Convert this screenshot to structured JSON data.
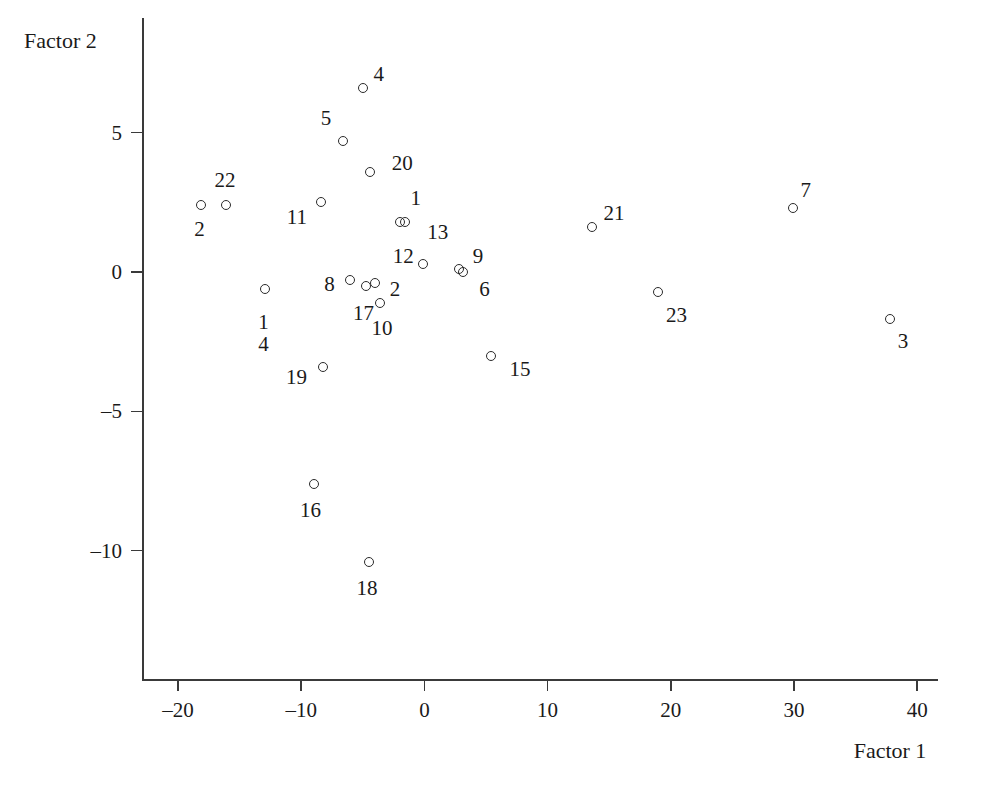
{
  "chart_data": {
    "type": "scatter",
    "title": "",
    "xlabel": "Factor 1",
    "ylabel": "Factor 2",
    "xlim": [
      -23.5,
      44
    ],
    "ylim": [
      -13.2,
      7.8
    ],
    "xticks": [
      -20,
      -10,
      0,
      10,
      20,
      30,
      40
    ],
    "xtick_labels": [
      "–20",
      "–10",
      "0",
      "10",
      "20",
      "30",
      "40"
    ],
    "yticks": [
      5,
      0,
      -5,
      -10
    ],
    "ytick_labels": [
      "5",
      "0",
      "–5",
      "–10"
    ],
    "grid": false,
    "legend": "none",
    "marker": "open-circle",
    "points": [
      {
        "label": "4",
        "x": -5.0,
        "y": 6.6,
        "label_dx": 16,
        "label_dy": -14
      },
      {
        "label": "5",
        "x": -6.6,
        "y": 4.7,
        "label_dx": -17,
        "label_dy": -23
      },
      {
        "label": "20",
        "x": -4.4,
        "y": 3.6,
        "label_dx": 32,
        "label_dy": -9
      },
      {
        "label": "22",
        "x": -16.1,
        "y": 2.4,
        "label_dx": -1,
        "label_dy": -25
      },
      {
        "label": "2",
        "x": -18.1,
        "y": 2.4,
        "label_dx": -2,
        "label_dy": 24
      },
      {
        "label": "11",
        "x": -8.4,
        "y": 2.5,
        "label_dx": -24,
        "label_dy": 15
      },
      {
        "label": "1",
        "x": -2.0,
        "y": 1.8,
        "label_dx": 16,
        "label_dy": -24
      },
      {
        "label": "13",
        "x": -1.6,
        "y": 1.8,
        "label_dx": 33,
        "label_dy": 10
      },
      {
        "label": "21",
        "x": 13.6,
        "y": 1.6,
        "label_dx": 22,
        "label_dy": -14
      },
      {
        "label": "7",
        "x": 29.9,
        "y": 2.3,
        "label_dx": 13,
        "label_dy": -18
      },
      {
        "label": "12",
        "x": -0.1,
        "y": 0.3,
        "label_dx": -20,
        "label_dy": -8
      },
      {
        "label": "9",
        "x": 2.8,
        "y": 0.1,
        "label_dx": 19,
        "label_dy": -13
      },
      {
        "label": "6",
        "x": 3.1,
        "y": 0.0,
        "label_dx": 22,
        "label_dy": 17
      },
      {
        "label": "8",
        "x": -6.0,
        "y": -0.3,
        "label_dx": -21,
        "label_dy": 4
      },
      {
        "label": "2b",
        "display": "2",
        "x": -4.0,
        "y": -0.4,
        "label_dx": 20,
        "label_dy": 6
      },
      {
        "label": "17",
        "x": -4.7,
        "y": -0.5,
        "label_dx": -3,
        "label_dy": 27
      },
      {
        "label": "10",
        "x": -3.6,
        "y": -1.1,
        "label_dx": 2,
        "label_dy": 25
      },
      {
        "label": "14",
        "display": "1\n4",
        "x": -12.9,
        "y": -0.6,
        "label_dx": -2,
        "label_dy": 44
      },
      {
        "label": "23",
        "x": 19.0,
        "y": -0.7,
        "label_dx": 18,
        "label_dy": 23
      },
      {
        "label": "3",
        "x": 37.8,
        "y": -1.7,
        "label_dx": 13,
        "label_dy": 22
      },
      {
        "label": "15",
        "x": 5.4,
        "y": -3.0,
        "label_dx": 29,
        "label_dy": 13
      },
      {
        "label": "19",
        "x": -8.2,
        "y": -3.4,
        "label_dx": -27,
        "label_dy": 10
      },
      {
        "label": "16",
        "x": -9.0,
        "y": -7.6,
        "label_dx": -3,
        "label_dy": 26
      },
      {
        "label": "18",
        "x": -4.5,
        "y": -10.4,
        "label_dx": -2,
        "label_dy": 26
      }
    ]
  },
  "axes": {
    "x_title": "Factor 1",
    "y_title": "Factor 2"
  }
}
